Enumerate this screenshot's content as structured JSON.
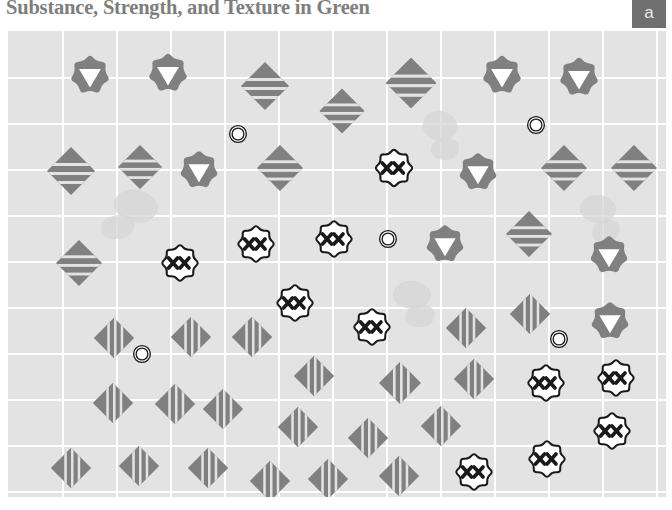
{
  "header": {
    "title": "Substance, Strength, and Texture in Green",
    "panel_badge": "a"
  },
  "colors": {
    "plot_background": "#e3e3e3",
    "gridline": "#ffffff",
    "marker_gray": "#808080",
    "marker_white": "#ffffff",
    "marker_outline": "#1a1a1a",
    "title_text": "#7e7e7e",
    "badge_background": "#6f6f6f",
    "badge_text": "#e8e8e8",
    "page_background": "#ffffff"
  },
  "chart_data": {
    "type": "scatter",
    "title": "Substance, Strength, and Texture in Green",
    "subtitle": "",
    "xlabel": "",
    "ylabel": "",
    "xlim": [
      0,
      658
    ],
    "ylim": [
      0,
      466
    ],
    "grid": true,
    "legend": null,
    "axis_ticks": {
      "x": [],
      "y": []
    },
    "gridlines": {
      "vertical_x": [
        54,
        108,
        162,
        216,
        270,
        324,
        378,
        432,
        486,
        540,
        594,
        648
      ],
      "horizontal_y": [
        46,
        92,
        138,
        184,
        230,
        276,
        322,
        368,
        414,
        460
      ]
    },
    "marker_types": [
      {
        "key": "flower-gray-triangle",
        "description": "gray scalloped flower with white downward triangle"
      },
      {
        "key": "diamond-hstripe",
        "description": "gray diamond with horizontal white stripes"
      },
      {
        "key": "diamond-vstripe",
        "description": "gray diamond with vertical white stripes"
      },
      {
        "key": "flower-white-xx",
        "description": "white scalloped flower outlined in black with two black x marks"
      },
      {
        "key": "ring-double",
        "description": "small white double-ring circle outlined in black"
      }
    ],
    "points": [
      {
        "type": "flower-gray-triangle",
        "x": 82,
        "y": 44,
        "size": 42
      },
      {
        "type": "flower-gray-triangle",
        "x": 160,
        "y": 42,
        "size": 42
      },
      {
        "type": "diamond-hstripe",
        "x": 257,
        "y": 55,
        "size": 50
      },
      {
        "type": "diamond-hstripe",
        "x": 334,
        "y": 80,
        "size": 47
      },
      {
        "type": "diamond-hstripe",
        "x": 403,
        "y": 52,
        "size": 53
      },
      {
        "type": "flower-gray-triangle",
        "x": 494,
        "y": 44,
        "size": 42
      },
      {
        "type": "flower-gray-triangle",
        "x": 571,
        "y": 46,
        "size": 42
      },
      {
        "type": "ring-double",
        "x": 230,
        "y": 103,
        "size": 19
      },
      {
        "type": "ring-double",
        "x": 528,
        "y": 94,
        "size": 19
      },
      {
        "type": "diamond-hstripe",
        "x": 63,
        "y": 140,
        "size": 50
      },
      {
        "type": "diamond-hstripe",
        "x": 132,
        "y": 136,
        "size": 46
      },
      {
        "type": "flower-gray-triangle",
        "x": 191,
        "y": 139,
        "size": 41
      },
      {
        "type": "diamond-hstripe",
        "x": 272,
        "y": 137,
        "size": 48
      },
      {
        "type": "flower-white-xx",
        "x": 386,
        "y": 137,
        "size": 42
      },
      {
        "type": "flower-gray-triangle",
        "x": 470,
        "y": 141,
        "size": 41
      },
      {
        "type": "diamond-hstripe",
        "x": 556,
        "y": 137,
        "size": 48
      },
      {
        "type": "diamond-hstripe",
        "x": 626,
        "y": 137,
        "size": 48
      },
      {
        "type": "diamond-hstripe",
        "x": 71,
        "y": 232,
        "size": 48
      },
      {
        "type": "flower-white-xx",
        "x": 172,
        "y": 232,
        "size": 41
      },
      {
        "type": "flower-white-xx",
        "x": 248,
        "y": 213,
        "size": 41
      },
      {
        "type": "flower-white-xx",
        "x": 326,
        "y": 208,
        "size": 41
      },
      {
        "type": "ring-double",
        "x": 380,
        "y": 208,
        "size": 19
      },
      {
        "type": "flower-gray-triangle",
        "x": 437,
        "y": 213,
        "size": 41
      },
      {
        "type": "diamond-hstripe",
        "x": 521,
        "y": 203,
        "size": 48
      },
      {
        "type": "flower-gray-triangle",
        "x": 601,
        "y": 224,
        "size": 41
      },
      {
        "type": "flower-white-xx",
        "x": 287,
        "y": 272,
        "size": 41
      },
      {
        "type": "flower-white-xx",
        "x": 364,
        "y": 296,
        "size": 41
      },
      {
        "type": "diamond-vstripe",
        "x": 106,
        "y": 307,
        "size": 42
      },
      {
        "type": "diamond-vstripe",
        "x": 183,
        "y": 306,
        "size": 42
      },
      {
        "type": "diamond-vstripe",
        "x": 244,
        "y": 306,
        "size": 42
      },
      {
        "type": "diamond-vstripe",
        "x": 458,
        "y": 297,
        "size": 42
      },
      {
        "type": "diamond-vstripe",
        "x": 522,
        "y": 283,
        "size": 42
      },
      {
        "type": "flower-gray-triangle",
        "x": 602,
        "y": 290,
        "size": 41
      },
      {
        "type": "ring-double",
        "x": 134,
        "y": 323,
        "size": 19
      },
      {
        "type": "ring-double",
        "x": 551,
        "y": 308,
        "size": 19
      },
      {
        "type": "diamond-vstripe",
        "x": 306,
        "y": 345,
        "size": 42
      },
      {
        "type": "diamond-vstripe",
        "x": 392,
        "y": 352,
        "size": 44
      },
      {
        "type": "diamond-vstripe",
        "x": 466,
        "y": 348,
        "size": 42
      },
      {
        "type": "flower-white-xx",
        "x": 538,
        "y": 352,
        "size": 41
      },
      {
        "type": "flower-white-xx",
        "x": 608,
        "y": 347,
        "size": 41
      },
      {
        "type": "diamond-vstripe",
        "x": 105,
        "y": 372,
        "size": 42
      },
      {
        "type": "diamond-vstripe",
        "x": 167,
        "y": 373,
        "size": 42
      },
      {
        "type": "diamond-vstripe",
        "x": 215,
        "y": 378,
        "size": 42
      },
      {
        "type": "diamond-vstripe",
        "x": 290,
        "y": 396,
        "size": 42
      },
      {
        "type": "diamond-vstripe",
        "x": 360,
        "y": 407,
        "size": 42
      },
      {
        "type": "diamond-vstripe",
        "x": 433,
        "y": 395,
        "size": 42
      },
      {
        "type": "flower-white-xx",
        "x": 604,
        "y": 400,
        "size": 41
      },
      {
        "type": "diamond-vstripe",
        "x": 63,
        "y": 437,
        "size": 42
      },
      {
        "type": "diamond-vstripe",
        "x": 131,
        "y": 435,
        "size": 42
      },
      {
        "type": "diamond-vstripe",
        "x": 200,
        "y": 437,
        "size": 42
      },
      {
        "type": "diamond-vstripe",
        "x": 262,
        "y": 450,
        "size": 42
      },
      {
        "type": "diamond-vstripe",
        "x": 320,
        "y": 448,
        "size": 42
      },
      {
        "type": "diamond-vstripe",
        "x": 391,
        "y": 445,
        "size": 42
      },
      {
        "type": "flower-white-xx",
        "x": 466,
        "y": 441,
        "size": 41
      },
      {
        "type": "flower-white-xx",
        "x": 539,
        "y": 428,
        "size": 41
      }
    ],
    "texture_blobs": [
      {
        "x": 128,
        "y": 175,
        "w": 44,
        "h": 32,
        "rot": 14
      },
      {
        "x": 110,
        "y": 196,
        "w": 34,
        "h": 24,
        "rot": -10
      },
      {
        "x": 432,
        "y": 95,
        "w": 34,
        "h": 30,
        "rot": 20
      },
      {
        "x": 437,
        "y": 118,
        "w": 28,
        "h": 22,
        "rot": -5
      },
      {
        "x": 590,
        "y": 178,
        "w": 36,
        "h": 28,
        "rot": 8
      },
      {
        "x": 598,
        "y": 200,
        "w": 28,
        "h": 22,
        "rot": -12
      },
      {
        "x": 404,
        "y": 264,
        "w": 38,
        "h": 28,
        "rot": 6
      },
      {
        "x": 412,
        "y": 285,
        "w": 30,
        "h": 22,
        "rot": -8
      }
    ]
  }
}
